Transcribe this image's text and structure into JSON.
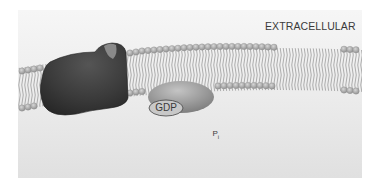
{
  "diagram": {
    "region_label": "EXTRACELLULAR",
    "molecules": {
      "gdp": "GDP",
      "phosphate": "P",
      "phosphate_subscript": "i"
    },
    "components": [
      {
        "id": "receptor",
        "description": "dark membrane receptor protein with binding pocket"
      },
      {
        "id": "g-protein",
        "description": "G-protein bound to GDP"
      },
      {
        "id": "effector",
        "description": "large kidney-shaped membrane protein"
      },
      {
        "id": "lipid-bilayer",
        "description": "phospholipid bilayer membrane"
      }
    ],
    "arrows": [
      {
        "from": "effector",
        "to": "g-protein"
      },
      {
        "from": "effector",
        "to": "phosphate"
      },
      {
        "from": "outside-left",
        "to": "receptor"
      }
    ],
    "colors": {
      "background_top": "#f4f4f4",
      "background_bottom": "#e2e2e2",
      "receptor": "#3c3c3c",
      "protein_gray": "#9a9a9a",
      "membrane_head": "#b5b5b5",
      "text": "#3a3a3a"
    }
  }
}
